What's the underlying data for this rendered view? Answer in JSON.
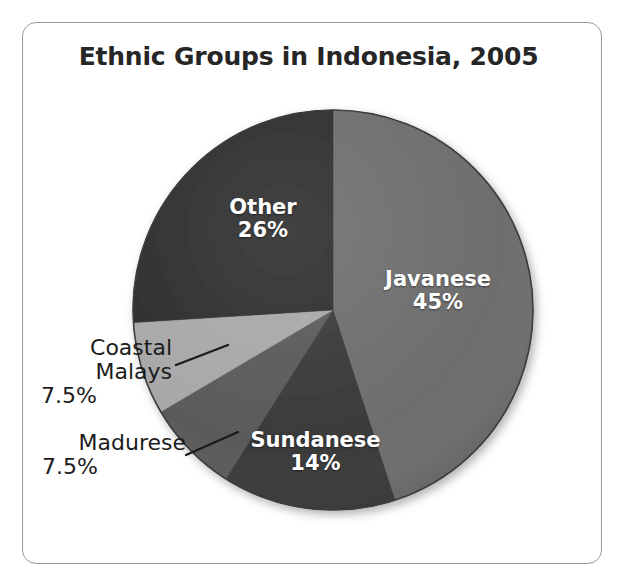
{
  "figure": {
    "frame_color": "#9a9a9a",
    "background": "#ffffff"
  },
  "chart_data": {
    "type": "pie",
    "title": "Ethnic Groups in Indonesia, 2005",
    "xlabel": "",
    "ylabel": "",
    "legend_position": "none",
    "grid": false,
    "units": "percent",
    "start_angle_deg": 0,
    "direction": "clockwise",
    "categories": [
      "Javanese",
      "Sundanese",
      "Madurese",
      "Coastal Malays",
      "Other"
    ],
    "values": [
      45,
      14,
      7.5,
      7.5,
      26
    ],
    "value_labels": [
      "45%",
      "14%",
      "7.5%",
      "7.5%",
      "26%"
    ],
    "colors": [
      "#6e6e6e",
      "#3a3a3a",
      "#5a5a5a",
      "#a8a8a8",
      "#2e2e2e"
    ],
    "slices": [
      {
        "name": "Javanese",
        "value": 45,
        "value_label": "45%",
        "color": "#6e6e6e",
        "label_placement": "inside",
        "label_color": "#ffffff",
        "start_deg": 0,
        "end_deg": 162
      },
      {
        "name": "Sundanese",
        "value": 14,
        "value_label": "14%",
        "color": "#3a3a3a",
        "label_placement": "inside",
        "label_color": "#ffffff",
        "start_deg": 162,
        "end_deg": 212.4
      },
      {
        "name": "Madurese",
        "value": 7.5,
        "value_label": "7.5%",
        "color": "#5a5a5a",
        "label_placement": "outside-left",
        "label_color": "#1c1c1c",
        "start_deg": 212.4,
        "end_deg": 239.4
      },
      {
        "name": "Coastal Malays",
        "value": 7.5,
        "value_label": "7.5%",
        "color": "#a8a8a8",
        "label_placement": "outside-left",
        "label_color": "#1c1c1c",
        "start_deg": 239.4,
        "end_deg": 266.4
      },
      {
        "name": "Other",
        "value": 26,
        "value_label": "26%",
        "color": "#2e2e2e",
        "label_placement": "inside",
        "label_color": "#ffffff",
        "start_deg": 266.4,
        "end_deg": 360
      }
    ]
  },
  "labels": {
    "javanese": {
      "name": "Javanese",
      "pct": "45%"
    },
    "sundanese": {
      "name": "Sundanese",
      "pct": "14%"
    },
    "other": {
      "name": "Other",
      "pct": "26%"
    },
    "coastal_malays": {
      "name_line1": "Coastal",
      "name_line2": "Malays",
      "pct": "7.5%"
    },
    "madurese": {
      "name": "Madurese",
      "pct": "7.5%"
    }
  }
}
